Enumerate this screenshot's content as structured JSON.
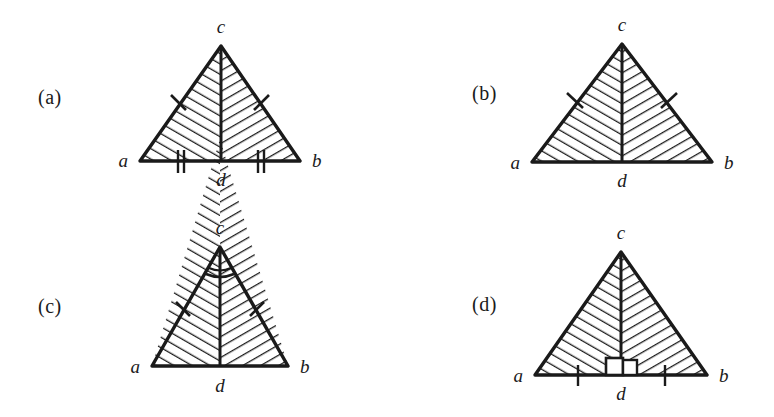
{
  "figure": {
    "background_color": "#ffffff",
    "ink_color": "#1a1a1a",
    "panel_count": 4,
    "shared_vertex_labels": {
      "apex": "c",
      "left": "a",
      "right": "b",
      "foot": "d"
    },
    "panels": [
      {
        "id": "a",
        "label": "(a)",
        "vertices": {
          "apex": "c",
          "left": "a",
          "right": "b",
          "foot": "d"
        },
        "marks": {
          "leg_ticks": 1,
          "base_ticks": 2,
          "right_angle_at_foot": false,
          "apex_angle_marks": 0
        }
      },
      {
        "id": "b",
        "label": "(b)",
        "vertices": {
          "apex": "c",
          "left": "a",
          "right": "b",
          "foot": "d"
        },
        "marks": {
          "leg_ticks": 1,
          "base_ticks": 0,
          "right_angle_at_foot": false,
          "apex_angle_marks": 0
        }
      },
      {
        "id": "c",
        "label": "(c)",
        "vertices": {
          "apex": "c",
          "left": "a",
          "right": "b",
          "foot": "d"
        },
        "marks": {
          "leg_ticks": 1,
          "base_ticks": 0,
          "right_angle_at_foot": false,
          "apex_angle_marks": 2
        }
      },
      {
        "id": "d",
        "label": "(d)",
        "vertices": {
          "apex": "c",
          "left": "a",
          "right": "b",
          "foot": "d"
        },
        "marks": {
          "leg_ticks": 0,
          "base_ticks": 1,
          "right_angle_at_foot": true,
          "apex_angle_marks": 0
        }
      }
    ]
  }
}
